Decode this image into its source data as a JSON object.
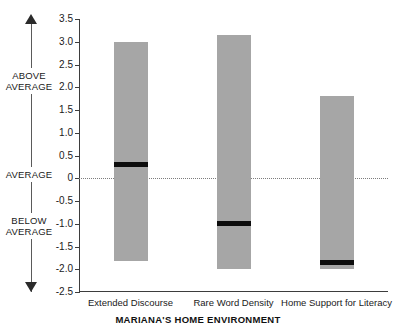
{
  "chart_data": {
    "type": "bar",
    "title": "MARIANA'S HOME ENVIRONMENT",
    "xlabel": "",
    "ylabel": "",
    "ylim": [
      -2.5,
      3.5
    ],
    "grid": false,
    "legend": "none",
    "zero_reference_line": 0,
    "categories": [
      "Extended Discourse",
      "Rare Word Density",
      "Home Support for Literacy"
    ],
    "yticks": [
      3.5,
      3.0,
      2.5,
      2.0,
      1.5,
      1.0,
      0.5,
      0,
      -0.5,
      -1.0,
      -1.5,
      -2.0,
      -2.5
    ],
    "ytick_labels": [
      "3.5",
      "3.0",
      "2.5",
      "2.0",
      "1.5",
      "1.0",
      "0.5",
      "0",
      "-0.5",
      "-1.0",
      "-1.5",
      "-2.0",
      "-2.5"
    ],
    "series": [
      {
        "name": "range",
        "description": "Gray range bar (top to bottom)",
        "tops": [
          3.0,
          3.15,
          1.8
        ],
        "bottoms": [
          -1.82,
          -2.0,
          -2.0
        ]
      },
      {
        "name": "median-marker",
        "description": "Black horizontal marker within each bar",
        "values": [
          0.3,
          -1.0,
          -1.85
        ]
      }
    ],
    "axis_annotations": {
      "above": "ABOVE\nAVERAGE",
      "average": "AVERAGE",
      "below": "BELOW\nAVERAGE"
    },
    "colors": {
      "bar_fill": "#a6a6a6",
      "marker": "#0d0d0d",
      "axis": "#3d3d3d",
      "zero_line": "#7d7d7d",
      "background": "#ffffff"
    }
  },
  "axis_band": {
    "above_line1": "ABOVE",
    "above_line2": "AVERAGE",
    "average": "AVERAGE",
    "below_line1": "BELOW",
    "below_line2": "AVERAGE"
  },
  "title": "MARIANA'S HOME ENVIRONMENT"
}
